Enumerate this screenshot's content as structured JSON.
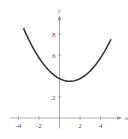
{
  "chart_data": {
    "type": "line",
    "title": "",
    "xlabel": "x",
    "ylabel": "y",
    "xlim": [
      -4.8,
      5.5
    ],
    "ylim": [
      -1,
      9.3
    ],
    "grid": false,
    "legend": null,
    "x_ticks": [
      -4,
      -2,
      2,
      4
    ],
    "y_ticks": [
      2,
      6,
      8
    ],
    "x_tick_labels": [
      "-4",
      "-2",
      "2",
      "4"
    ],
    "y_tick_labels": [
      "2",
      "6",
      "8"
    ],
    "series": [
      {
        "name": "curve",
        "color": "#3a3a3a",
        "function_estimate": "y = 0.25(x-1)^2 + 3.5",
        "x": [
          -3.5,
          -3,
          -2,
          -1,
          0,
          1,
          2,
          3,
          4,
          5
        ],
        "y": [
          8.56,
          7.5,
          5.75,
          4.5,
          3.75,
          3.5,
          3.75,
          4.5,
          5.75,
          7.5
        ]
      }
    ]
  }
}
